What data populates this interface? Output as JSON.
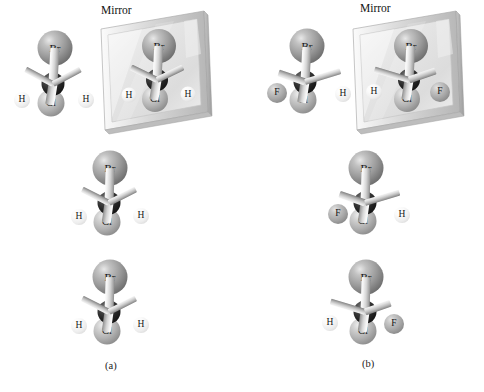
{
  "figure": {
    "background": "#ffffff",
    "width": 484,
    "height": 392
  },
  "colors": {
    "bromine": "#9b9b9b",
    "chlorine": "#b2b2b2",
    "carbon": "#252525",
    "hydrogen": "#ededed",
    "fluorine": "#a8a8a8",
    "bond": "#d5d5d5",
    "mirror_frame": "#c9c9c9",
    "mirror_glass": "#e9e9e9",
    "text": "#111111"
  },
  "labels": {
    "mirror_a": "Mirror",
    "mirror_b": "Mirror",
    "caption_a": "(a)",
    "caption_b": "(b)"
  },
  "atom_symbols": {
    "bromine": "Br",
    "chlorine": "Cl",
    "carbon": "C",
    "hydrogen": "H",
    "fluorine": "F"
  },
  "panels": [
    {
      "id": "a",
      "caption": "(a)",
      "mirror_label": "Mirror",
      "molecules": [
        {
          "id": "a-row1-left",
          "name": "bromochloromethane-original",
          "formula": "CH2BrCl",
          "atoms": [
            {
              "element": "Br",
              "label": "Br"
            },
            {
              "element": "C",
              "label": "C"
            },
            {
              "element": "Cl",
              "label": "Cl"
            },
            {
              "element": "H",
              "label": "H"
            },
            {
              "element": "H",
              "label": "H"
            }
          ]
        },
        {
          "id": "a-row1-mirror",
          "name": "bromochloromethane-mirror-image",
          "formula": "CH2BrCl",
          "atoms": [
            {
              "element": "Br",
              "label": "Br"
            },
            {
              "element": "C",
              "label": "C"
            },
            {
              "element": "Cl",
              "label": "Cl"
            },
            {
              "element": "H",
              "label": "H"
            },
            {
              "element": "H",
              "label": "H"
            }
          ]
        },
        {
          "id": "a-row2",
          "name": "bromochloromethane-rotated",
          "formula": "CH2BrCl",
          "atoms": [
            {
              "element": "Br",
              "label": "Br"
            },
            {
              "element": "C",
              "label": "C"
            },
            {
              "element": "Cl",
              "label": "Cl"
            },
            {
              "element": "H",
              "label": "H"
            },
            {
              "element": "H",
              "label": "H"
            }
          ]
        },
        {
          "id": "a-row3",
          "name": "bromochloromethane-superimposed",
          "formula": "CH2BrCl",
          "atoms": [
            {
              "element": "Br",
              "label": "Br"
            },
            {
              "element": "C",
              "label": "C"
            },
            {
              "element": "Cl",
              "label": "Cl"
            },
            {
              "element": "H",
              "label": "H"
            },
            {
              "element": "H",
              "label": "H"
            }
          ]
        }
      ]
    },
    {
      "id": "b",
      "caption": "(b)",
      "mirror_label": "Mirror",
      "molecules": [
        {
          "id": "b-row1-left",
          "name": "bromochlorofluoromethane-original",
          "formula": "CHBrClF",
          "atoms": [
            {
              "element": "Br",
              "label": "Br"
            },
            {
              "element": "C",
              "label": "C"
            },
            {
              "element": "Cl",
              "label": "Cl"
            },
            {
              "element": "F",
              "label": "F"
            },
            {
              "element": "H",
              "label": "H"
            }
          ]
        },
        {
          "id": "b-row1-mirror",
          "name": "bromochlorofluoromethane-mirror-image",
          "formula": "CHBrClF",
          "atoms": [
            {
              "element": "Br",
              "label": "Br"
            },
            {
              "element": "C",
              "label": "C"
            },
            {
              "element": "Cl",
              "label": "Cl"
            },
            {
              "element": "H",
              "label": "H"
            },
            {
              "element": "F",
              "label": "F"
            }
          ]
        },
        {
          "id": "b-row2",
          "name": "bromochlorofluoromethane-enantiomer-1",
          "formula": "CHBrClF",
          "atoms": [
            {
              "element": "Br",
              "label": "Br"
            },
            {
              "element": "C",
              "label": "C"
            },
            {
              "element": "Cl",
              "label": "Cl"
            },
            {
              "element": "F",
              "label": "F"
            },
            {
              "element": "H",
              "label": "H"
            }
          ]
        },
        {
          "id": "b-row3",
          "name": "bromochlorofluoromethane-enantiomer-2",
          "formula": "CHBrClF",
          "atoms": [
            {
              "element": "Br",
              "label": "Br"
            },
            {
              "element": "C",
              "label": "C"
            },
            {
              "element": "Cl",
              "label": "Cl"
            },
            {
              "element": "H",
              "label": "H"
            },
            {
              "element": "F",
              "label": "F"
            }
          ]
        }
      ]
    }
  ],
  "atom_text": {
    "br": "Br",
    "cl": "Cl",
    "f": "F",
    "h": "H"
  }
}
